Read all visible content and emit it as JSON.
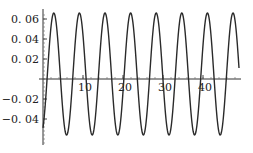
{
  "chart_data": {
    "type": "line",
    "title": "",
    "xlabel": "",
    "ylabel": "",
    "xlim": [
      0,
      49.5
    ],
    "ylim": [
      -0.06,
      0.068
    ],
    "grid": false,
    "legend": null,
    "x_ticks": [
      10,
      20,
      30,
      40
    ],
    "x_tick_labels": [
      "10",
      "20",
      "30",
      "40"
    ],
    "y_ticks": [
      0.06,
      0.04,
      0.02,
      -0.02,
      -0.04
    ],
    "y_tick_labels": [
      "0.06",
      "0.04",
      "0.02",
      "-0.02",
      "-0.04"
    ],
    "series": [
      {
        "name": "y(t)",
        "function_estimate": "0.005 + 0.061*sin(t - 1.1)",
        "peaks_x": [
          2.7,
          9.0,
          15.2,
          21.7,
          28.2,
          34.7,
          41.2,
          47.5
        ],
        "peak_value": 0.066,
        "troughs_x": [
          5.8,
          12.0,
          18.5,
          24.7,
          31.2,
          37.7,
          44.2
        ],
        "trough_value": -0.056,
        "x_start": 0,
        "y_start": -0.047,
        "x_end": 49,
        "y_end": 0.016
      }
    ]
  },
  "plot_area": {
    "origin_px": [
      43,
      79
    ],
    "x_px_per_unit": 4.0,
    "y_px_per_unit": 1000
  }
}
